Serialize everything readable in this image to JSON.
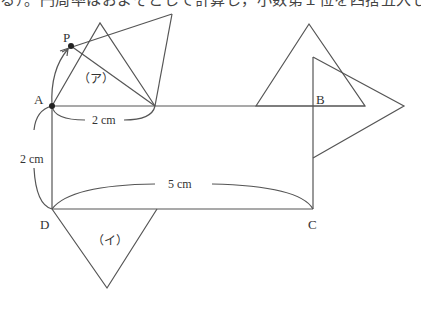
{
  "header": {
    "clipped_text": "る）。円周率はおよそとして計算し，小数第１位を四捨五入しなさい。"
  },
  "diagram": {
    "points": {
      "A": {
        "label": "A",
        "x": 52,
        "y": 106
      },
      "B": {
        "label": "B",
        "x": 313,
        "y": 106
      },
      "C": {
        "label": "C",
        "x": 313,
        "y": 209
      },
      "D": {
        "label": "D",
        "x": 52,
        "y": 209
      },
      "P": {
        "label": "P",
        "x": 71,
        "y": 46
      }
    },
    "regions": {
      "a": "（ア）",
      "i": "（イ）"
    },
    "dimensions": {
      "top": "2 cm",
      "left": "2 cm",
      "bottom": "5 cm"
    },
    "colors": {
      "line": "#555555",
      "text": "#333333"
    }
  }
}
